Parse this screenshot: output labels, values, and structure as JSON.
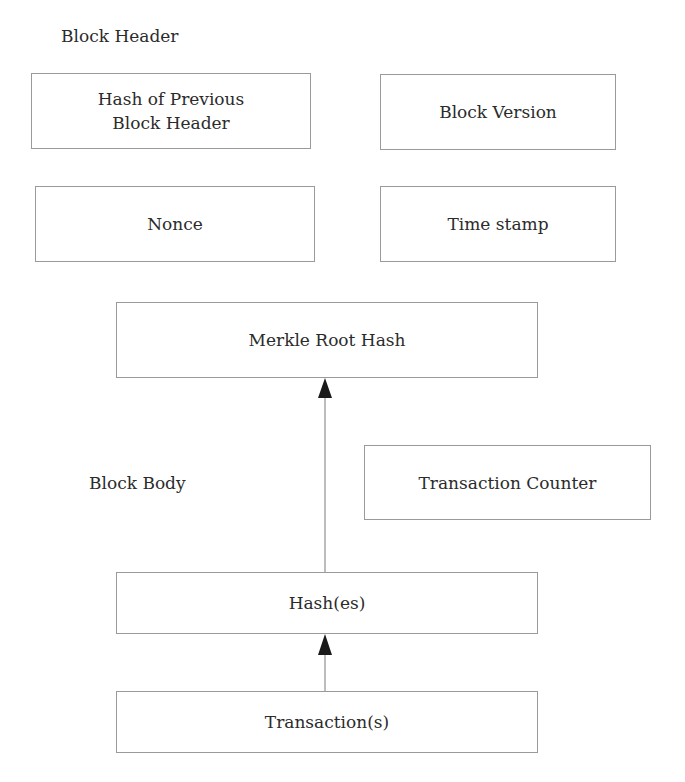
{
  "sections": {
    "header_label": "Block Header",
    "body_label": "Block Body"
  },
  "header_fields": {
    "prev_hash": [
      "Hash of Previous",
      "Block Header"
    ],
    "version": "Block Version",
    "nonce": "Nonce",
    "timestamp": "Time stamp"
  },
  "body_fields": {
    "merkle_root": "Merkle Root Hash",
    "tx_counter": "Transaction Counter",
    "hashes": "Hash(es)",
    "transactions": "Transaction(s)"
  },
  "edges": [
    {
      "from": "transactions",
      "to": "hashes"
    },
    {
      "from": "hashes",
      "to": "merkle_root"
    }
  ],
  "colors": {
    "border": "#9a9a9a",
    "text": "#2b2b2b",
    "arrow": "#1a1a1a"
  }
}
